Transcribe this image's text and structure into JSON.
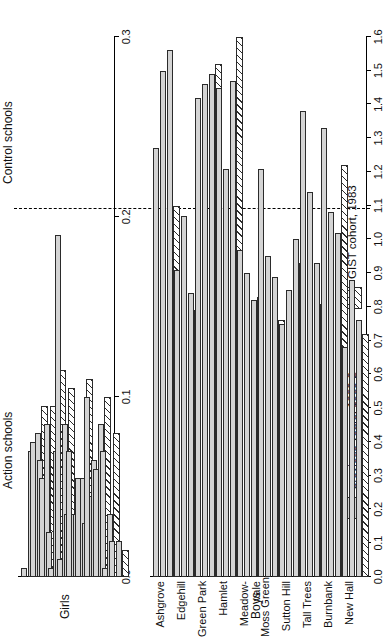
{
  "figure": {
    "orientation": "rotated-90-ccw",
    "group_labels": {
      "action": "Action schools",
      "control": "Control schools"
    },
    "legend": {
      "previous_label": "previous years, 1980-2",
      "gist_label": "GIST cohort, 1983",
      "previous_swatch": "solid-grey-swatch",
      "gist_swatch": "hatched-swatch"
    },
    "colors": {
      "bar_fill": "#d4d4d4",
      "bar_edge": "#2b2b2b",
      "hatch": "#2b2b2b"
    }
  },
  "chart_data": [
    {
      "type": "bar",
      "id": "girls-panel",
      "title": "",
      "ylabel": "Girls",
      "xlabel": "",
      "orientation": "horizontal-grouped",
      "ylim": [
        0.0,
        0.3
      ],
      "yticks": [
        0.0,
        0.1,
        0.2,
        0.3
      ],
      "ytick_labels": [
        "0.0",
        "0.1",
        "0.2",
        "0.3"
      ],
      "grid": false,
      "legend_position": "below-right",
      "categories": [
        "Ashgrove",
        "Edgehill",
        "Green Park",
        "Hamlet",
        "Meadow-vale",
        "Moss Green",
        "Sutton Hill",
        "Tall Trees",
        "Burnbank",
        "New Hall"
      ],
      "group_of_category": [
        "action",
        "action",
        "action",
        "action",
        "action",
        "action",
        "action",
        "action",
        "control",
        "control"
      ],
      "series": [
        {
          "name": "previous years, 1980-2 (a)",
          "kind": "prev",
          "values": [
            0.005,
            0.075,
            0.055,
            0.005,
            0.01,
            0.07,
            0.055,
            0.1,
            0.06,
            0.005
          ]
        },
        {
          "name": "previous years, 1980-2 (b)",
          "kind": "prev",
          "values": [
            0.07,
            0.065,
            0.025,
            0.19,
            0.035,
            0.035,
            0.03,
            0.065,
            0.07,
            0.02
          ]
        },
        {
          "name": "previous years, 1980-2 (c)",
          "kind": "prev",
          "values": [
            0.08,
            0.085,
            0.07,
            0.085,
            0.035,
            0.055,
            0.045,
            0.085,
            0.035,
            0.02
          ]
        },
        {
          "name": "GIST cohort, 1983",
          "kind": "gist",
          "values": [
            0.095,
            0.095,
            0.115,
            0.105,
            0.04,
            0.11,
            0.055,
            0.1,
            0.08,
            0.015
          ]
        }
      ]
    },
    {
      "type": "bar",
      "id": "boys-panel",
      "title": "",
      "ylabel": "Boys",
      "xlabel": "",
      "orientation": "horizontal-grouped",
      "ylim": [
        0.0,
        1.6
      ],
      "yticks": [
        0.0,
        0.1,
        0.2,
        0.3,
        0.4,
        0.5,
        0.6,
        0.7,
        0.8,
        0.9,
        1.0,
        1.1,
        1.2,
        1.3,
        1.4,
        1.5,
        1.6
      ],
      "ytick_labels": [
        "0.0",
        "0.1",
        "0.2",
        "0.3",
        "0.4",
        "0.5",
        "0.6",
        "0.7",
        "0.8",
        "0.9",
        "1.0",
        "1.1",
        "1.2",
        "1.3",
        "1.4",
        "1.5",
        "1.6"
      ],
      "grid": false,
      "legend_position": "below-right",
      "categories": [
        "Ashgrove",
        "Edgehill",
        "Green Park",
        "Hamlet",
        "Meadow-vale",
        "Moss Green",
        "Sutton Hill",
        "Tall Trees",
        "Burnbank",
        "New Hall"
      ],
      "group_of_category": [
        "action",
        "action",
        "action",
        "action",
        "action",
        "action",
        "action",
        "action",
        "control",
        "control"
      ],
      "series": [
        {
          "name": "previous years, 1980-2 (a)",
          "kind": "prev",
          "values": [
            1.27,
            0.91,
            1.42,
            1.45,
            0.97,
            1.21,
            0.75,
            1.38,
            1.33,
            0.68
          ]
        },
        {
          "name": "previous years, 1980-2 (b)",
          "kind": "prev",
          "values": [
            1.5,
            1.07,
            1.46,
            1.21,
            0.9,
            0.95,
            0.85,
            1.14,
            1.08,
            0.88
          ]
        },
        {
          "name": "previous years, 1980-2 (c)",
          "kind": "prev",
          "values": [
            1.56,
            0.84,
            1.49,
            1.47,
            0.82,
            0.89,
            1.0,
            0.93,
            1.02,
            0.76
          ]
        },
        {
          "name": "GIST cohort, 1983",
          "kind": "gist",
          "values": [
            1.1,
            0.79,
            1.52,
            1.6,
            0.83,
            0.76,
            0.93,
            0.81,
            1.22,
            0.72
          ]
        }
      ]
    }
  ]
}
